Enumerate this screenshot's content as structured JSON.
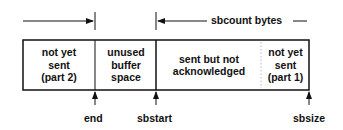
{
  "diagram": {
    "top_label": "sbcount bytes",
    "segments": [
      {
        "id": "part2",
        "text": "not yet\nsent\n(part 2)"
      },
      {
        "id": "unused",
        "text": "unused\nbuffer\nspace"
      },
      {
        "id": "sent",
        "text": "sent but not\nacknowledged"
      },
      {
        "id": "part1",
        "text": "not yet\nsent\n(part 1)"
      }
    ],
    "pointers": [
      {
        "id": "end",
        "label": "end"
      },
      {
        "id": "sbstart",
        "label": "sbstart"
      },
      {
        "id": "sbsize",
        "label": "sbsize"
      }
    ],
    "colors": {
      "line": "#111111",
      "dotted": "#bbbbbb"
    }
  }
}
